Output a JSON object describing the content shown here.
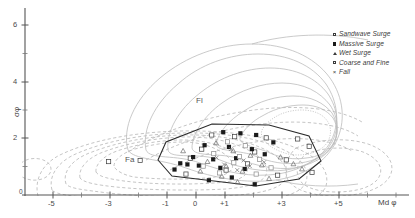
{
  "chart_data": {
    "type": "scatter",
    "title": "",
    "xlabel": "Md φ",
    "ylabel": "σφ",
    "xlim": [
      -6.8,
      7.6
    ],
    "ylim": [
      -0.25,
      6.6
    ],
    "grid": false,
    "legend_position": "top-right",
    "xticks": [
      -5,
      -3,
      -1,
      0,
      1,
      3,
      5
    ],
    "xtick_labels": [
      "-5",
      "-3",
      "-1",
      "0",
      "+1",
      "+3",
      "+5"
    ],
    "xminor": [
      -6,
      -4,
      -2,
      2,
      4,
      6
    ],
    "yticks": [
      2,
      4,
      6
    ],
    "ytick_labels": [
      "2",
      "4",
      "6"
    ],
    "yminor": [
      1,
      3,
      5
    ],
    "origin_label": "0",
    "field_labels": [
      {
        "text": "Fl",
        "x": 0.05,
        "y": 3.18
      },
      {
        "text": "Fa",
        "x": -2.45,
        "y": 1.42
      }
    ],
    "series": [
      {
        "name": "Sandwave Surge",
        "marker": "open-square",
        "color": "#3a3a3a",
        "points": [
          [
            0.55,
            2.12
          ],
          [
            1.35,
            2.06
          ],
          [
            2.45,
            2.02
          ],
          [
            3.55,
            1.98
          ],
          [
            0.2,
            1.62
          ],
          [
            -0.2,
            1.3
          ],
          [
            2.05,
            1.52
          ],
          [
            3.15,
            1.24
          ],
          [
            -0.35,
            0.74
          ],
          [
            1.05,
            0.88
          ],
          [
            2.85,
            0.7
          ],
          [
            4.05,
            0.8
          ],
          [
            -1.95,
            1.22
          ],
          [
            -3.05,
            1.18
          ],
          [
            3.95,
            1.72
          ],
          [
            1.8,
            1.1
          ]
        ]
      },
      {
        "name": "Massive Surge",
        "marker": "filled-square",
        "color": "#1a1a1a",
        "points": [
          [
            0.95,
            2.22
          ],
          [
            1.55,
            2.18
          ],
          [
            2.1,
            2.12
          ],
          [
            0.3,
            1.76
          ],
          [
            1.15,
            1.7
          ],
          [
            1.95,
            1.62
          ],
          [
            -0.1,
            1.34
          ],
          [
            0.6,
            1.26
          ],
          [
            1.4,
            1.3
          ],
          [
            -0.55,
            1.12
          ],
          [
            -0.3,
            1.08
          ],
          [
            0.1,
            1.04
          ],
          [
            0.85,
            0.96
          ],
          [
            1.7,
            0.92
          ],
          [
            2.4,
            1.44
          ],
          [
            0.45,
            0.52
          ],
          [
            2.05,
            0.38
          ],
          [
            -0.75,
            0.9
          ],
          [
            2.7,
            1.86
          ],
          [
            1.25,
            0.62
          ]
        ]
      },
      {
        "name": "Wet Surge",
        "marker": "triangle",
        "color": "#6a6a6a",
        "points": [
          [
            0.7,
            1.84
          ],
          [
            1.3,
            1.56
          ],
          [
            1.9,
            1.4
          ],
          [
            0.4,
            1.18
          ],
          [
            1.05,
            1.02
          ],
          [
            1.62,
            0.84
          ],
          [
            2.3,
            1.06
          ],
          [
            0.15,
            0.84
          ],
          [
            2.95,
            1.34
          ],
          [
            3.4,
            1.1
          ],
          [
            0.9,
            0.66
          ],
          [
            1.45,
            0.46
          ],
          [
            2.55,
            0.58
          ],
          [
            -0.45,
            1.56
          ],
          [
            3.7,
            0.92
          ]
        ]
      },
      {
        "name": "Coarse and Fine",
        "marker": "open-square",
        "color": "#8a8a8a",
        "points": [
          [
            1.1,
            1.88
          ],
          [
            1.72,
            1.74
          ],
          [
            0.62,
            1.46
          ],
          [
            2.22,
            1.26
          ],
          [
            1.32,
            1.14
          ],
          [
            0.82,
            0.78
          ],
          [
            2.62,
            0.96
          ],
          [
            1.52,
            1.36
          ],
          [
            0.25,
            1.02
          ],
          [
            2.1,
            0.74
          ]
        ]
      },
      {
        "name": "Fall",
        "marker": "x",
        "color": "#7a7a7a",
        "points": [
          [
            1.22,
            1.62
          ],
          [
            1.66,
            1.22
          ],
          [
            0.98,
            1.08
          ],
          [
            1.44,
            0.88
          ],
          [
            1.88,
            1.02
          ],
          [
            0.72,
            1.32
          ],
          [
            2.38,
            1.16
          ]
        ]
      }
    ],
    "envelope": {
      "name": "data-envelope-polygon",
      "style": "solid",
      "color": "#2a2a2a",
      "vertices": [
        [
          0.55,
          2.3
        ],
        [
          2.55,
          2.26
        ],
        [
          3.95,
          1.86
        ],
        [
          4.35,
          1.0
        ],
        [
          3.6,
          0.36
        ],
        [
          2.05,
          0.12
        ],
        [
          0.6,
          0.3
        ],
        [
          -0.85,
          0.52
        ],
        [
          -1.35,
          1.1
        ],
        [
          -1.05,
          1.82
        ]
      ]
    },
    "contours_solid": {
      "label": "Fl",
      "style": "solid",
      "color": "#b9b9b9",
      "levels": 5
    },
    "contours_dashed": {
      "label": "Fa",
      "style": "dashed",
      "color": "#b2b2b2",
      "levels": 5
    }
  },
  "legend": {
    "items": [
      {
        "label": "Sandwave Surge",
        "marker": "open-square"
      },
      {
        "label": "Massive Surge",
        "marker": "filled-square"
      },
      {
        "label": "Wet Surge",
        "marker": "triangle"
      },
      {
        "label": "Coarse and Fine",
        "marker": "open-square"
      },
      {
        "label": "Fall",
        "marker": "x"
      }
    ]
  }
}
